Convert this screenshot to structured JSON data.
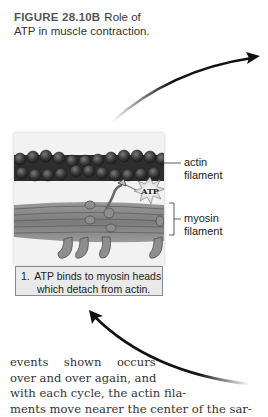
{
  "figure": {
    "number": "FIGURE 28.10B",
    "title": "Role of ATP in muscle contraction.",
    "title_line1": "Role of",
    "title_line2": "ATP in muscle contraction."
  },
  "illustration": {
    "atp_label": "ATP",
    "labels": {
      "actin_line1": "actin",
      "actin_line2": "filament",
      "myosin_line1": "myosin",
      "myosin_line2": "filament"
    },
    "colors": {
      "actin": "#3a3a3a",
      "myosin": "#8a8a8a",
      "panel_bg": "#f2f2f2"
    }
  },
  "step": {
    "number": "1.",
    "line1": "ATP binds to myosin heads",
    "line2": "which detach from actin."
  },
  "body_text": {
    "lines": [
      "events  shown  occurs",
      "over and over again, and",
      "with each cycle, the actin fila-",
      "ments move nearer the center of the sar-"
    ]
  },
  "arrows": [
    {
      "name": "cycle-arrow-forward",
      "direction": "up-right"
    },
    {
      "name": "cycle-arrow-return",
      "direction": "up-left"
    }
  ]
}
